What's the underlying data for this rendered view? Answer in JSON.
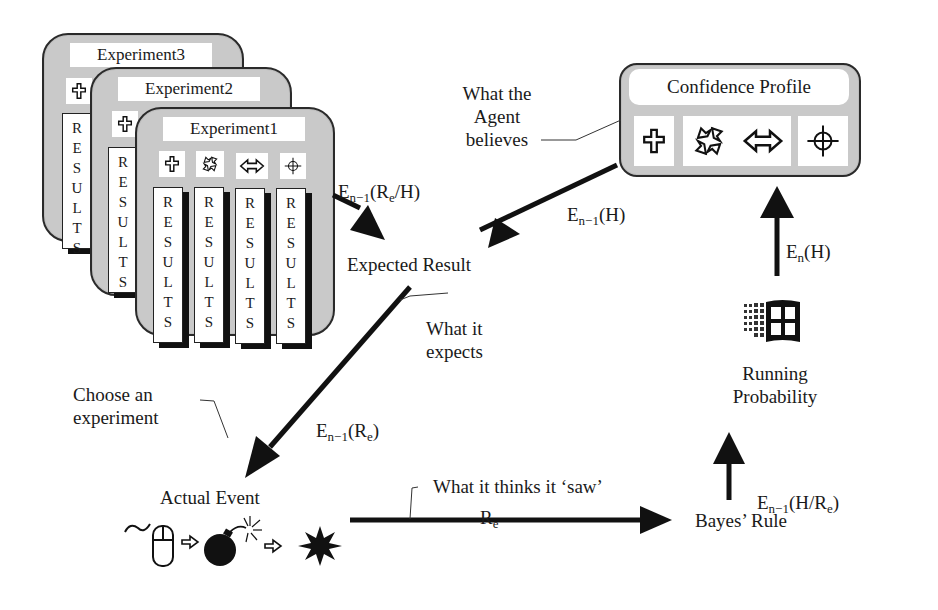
{
  "experiments": [
    {
      "title": "Experiment3",
      "icons": [
        "cross-icon"
      ],
      "results_label": "RESULTS"
    },
    {
      "title": "Experiment2",
      "icons": [
        "cross-icon"
      ],
      "results_label": "RESULTS"
    },
    {
      "title": "Experiment1",
      "icons": [
        "cross-icon",
        "cycle-arrows-icon",
        "double-arrow-icon",
        "crosshair-icon"
      ],
      "results_label": "RESULTS"
    }
  ],
  "results_letters": [
    "R",
    "E",
    "S",
    "U",
    "L",
    "T",
    "S"
  ],
  "confidence_profile": {
    "title": "Confidence Profile",
    "icons": [
      "cross-icon",
      "cycle-arrows-icon",
      "double-arrow-icon",
      "crosshair-icon"
    ]
  },
  "nodes": {
    "expected_result": "Expected Result",
    "actual_event": "Actual Event",
    "bayes_rule": "Bayes’ Rule",
    "running_probability_line1": "Running",
    "running_probability_line2": "Probability"
  },
  "annotations": {
    "agent_believes_1": "What the",
    "agent_believes_2": "Agent",
    "agent_believes_3": "believes",
    "what_it_expects_1": "What it",
    "what_it_expects_2": "expects",
    "choose_experiment_1": "Choose an",
    "choose_experiment_2": "experiment",
    "what_it_saw": "What it thinks it ‘saw’"
  },
  "edge_labels": {
    "exp_to_expected": {
      "E": "E",
      "sub": "n−1",
      "rest": "(R",
      "sub2": "e",
      "tail": "/H)"
    },
    "profile_to_expected": {
      "E": "E",
      "sub": "n−1",
      "rest": "(H)"
    },
    "expected_to_actual": {
      "E": "E",
      "sub": "n−1",
      "rest": "(R",
      "sub2": "e",
      "tail": ")"
    },
    "actual_to_bayes": {
      "R": "R",
      "sub": "e"
    },
    "bayes_to_running": {
      "E": "E",
      "sub": "n−1",
      "rest": "(H/R",
      "sub2": "e",
      "tail": ")"
    },
    "running_to_profile": {
      "E": "E",
      "sub": "n",
      "rest": "(H)"
    }
  },
  "event_sequence_icons": [
    "mouse-icon",
    "small-arrow-icon",
    "bomb-icon",
    "small-arrow-icon",
    "explosion-icon"
  ],
  "colors": {
    "card_fill": "#c9c9c9",
    "ink": "#1a1a1a",
    "paper": "#ffffff"
  }
}
